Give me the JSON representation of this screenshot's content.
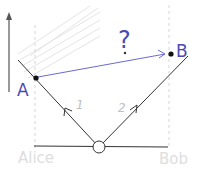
{
  "diagram": {
    "type": "spacetime-diagram",
    "labels": {
      "event_a": "A",
      "event_b": "B",
      "question": "?",
      "path_1": "1",
      "path_2": "2",
      "observer_left": "Alice",
      "observer_right": "Bob"
    },
    "colors": {
      "ink": "#2a2a2a",
      "blue": "#6a6ad0",
      "faint": "#d8d8d8",
      "hatch": "#e2e2e2"
    }
  }
}
